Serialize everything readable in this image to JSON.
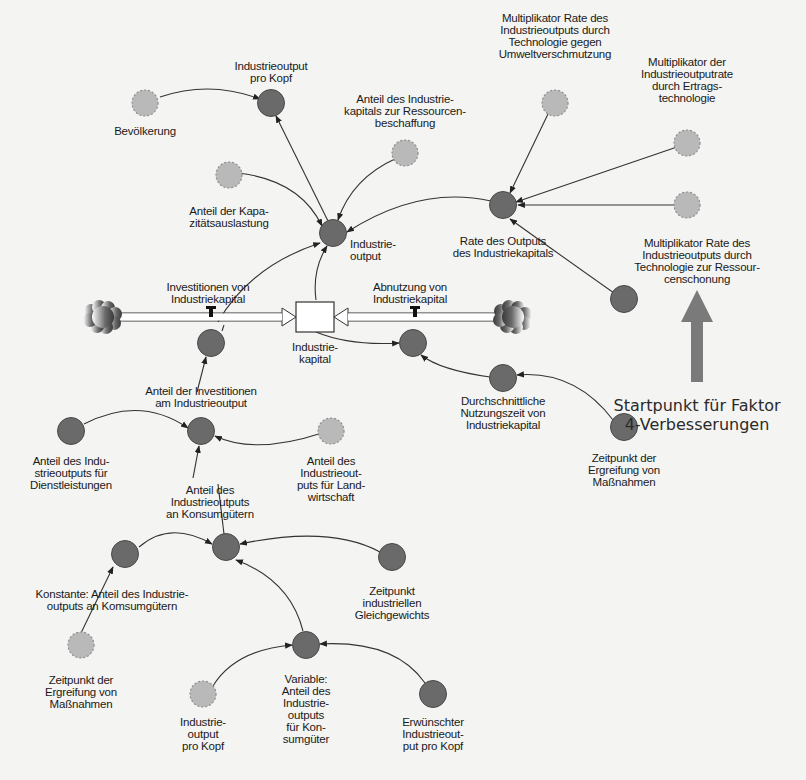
{
  "diagram": {
    "title": "",
    "colors": {
      "background": "#f4f4f2",
      "auxiliary_fill": "#6a6a6a",
      "auxiliary_stroke": "#4a4a4a",
      "external_fill": "#b9b9b9",
      "external_stroke": "#8e8e8e",
      "link": "#333333",
      "callout_arrow": "#7a7a7a",
      "stock_fill": "#ffffff"
    },
    "nodes": [
      {
        "id": "bevoelkerung",
        "type": "external",
        "x": 145,
        "y": 103,
        "label": "Bevölkerung",
        "lx": 145,
        "ly": 125
      },
      {
        "id": "io_pro_kopf",
        "type": "auxiliary",
        "x": 271,
        "y": 103,
        "label": "Industrieoutput\npro Kopf",
        "lx": 271,
        "ly": 60
      },
      {
        "id": "anteil_kapital_ressourcen",
        "type": "external",
        "x": 405,
        "y": 153,
        "label": "Anteil des Industrie-\nkapitals zur Ressourcen-\nbeschaffung",
        "lx": 405,
        "ly": 93
      },
      {
        "id": "kapazitaet",
        "type": "external",
        "x": 229,
        "y": 175,
        "label": "Anteil der Kapa-\nzitätsauslastung",
        "lx": 229,
        "ly": 205
      },
      {
        "id": "industrieoutput",
        "type": "auxiliary",
        "x": 333,
        "y": 233,
        "label": "Industrie-\noutput",
        "lx": 350,
        "ly": 238,
        "align": "left"
      },
      {
        "id": "mult_umwelt",
        "type": "external",
        "x": 555,
        "y": 103,
        "label": "Multiplikator Rate des\nIndustrieoutputs durch\nTechnologie gegen\nUmweltverschmutzung",
        "lx": 555,
        "ly": 12
      },
      {
        "id": "mult_ertrag",
        "type": "external",
        "x": 687,
        "y": 143,
        "label": "Multiplikator der\nIndustrieoutputrate\ndurch Ertrags-\ntechnologie",
        "lx": 687,
        "ly": 56
      },
      {
        "id": "mult_ressourcen_ext",
        "type": "external",
        "x": 687,
        "y": 205,
        "label": "",
        "lx": 0,
        "ly": 0
      },
      {
        "id": "rate_output",
        "type": "auxiliary",
        "x": 503,
        "y": 205,
        "label": "Rate des Outputs\ndes Industriekapitals",
        "lx": 503,
        "ly": 235
      },
      {
        "id": "mult_ressourcen",
        "type": "auxiliary",
        "x": 624,
        "y": 299,
        "label": "Multiplikator Rate des\nIndustrieoutputs durch\nTechnologie zur Ressour-\ncenschonung",
        "lx": 697,
        "ly": 237
      },
      {
        "id": "investitionen_aux",
        "type": "auxiliary",
        "x": 211,
        "y": 343,
        "label": "",
        "lx": 0,
        "ly": 0
      },
      {
        "id": "abnutzung_aux",
        "type": "auxiliary",
        "x": 413,
        "y": 343,
        "label": "",
        "lx": 0,
        "ly": 0
      },
      {
        "id": "nutzungszeit",
        "type": "auxiliary",
        "x": 503,
        "y": 378,
        "label": "Durchschnittliche\nNutzungszeit von\nIndustriekapital",
        "lx": 503,
        "ly": 395
      },
      {
        "id": "zeitpunkt_massnahmen_r",
        "type": "auxiliary",
        "x": 624,
        "y": 427,
        "label": "Zeitpunkt der\nErgreifung von\nMaßnahmen",
        "lx": 624,
        "ly": 452
      },
      {
        "id": "anteil_investitionen",
        "type": "auxiliary",
        "x": 201,
        "y": 431,
        "label": "Anteil der Investitionen\nam Industrieoutput",
        "lx": 201,
        "ly": 385
      },
      {
        "id": "anteil_dienstleistungen",
        "type": "auxiliary",
        "x": 71,
        "y": 431,
        "label": "Anteil des Indu-\nstrieoutputs für\nDienstleistungen",
        "lx": 71,
        "ly": 455
      },
      {
        "id": "anteil_landwirtschaft",
        "type": "external",
        "x": 331,
        "y": 431,
        "label": "Anteil des\nIndustrieout-\nputs für Land-\nwirtschaft",
        "lx": 331,
        "ly": 455
      },
      {
        "id": "anteil_konsumgueter",
        "type": "auxiliary",
        "x": 226,
        "y": 547,
        "label": "Anteil des\nIndustrieoutputs\nan Konsumgütern",
        "lx": 210,
        "ly": 484
      },
      {
        "id": "konstante",
        "type": "auxiliary",
        "x": 125,
        "y": 554,
        "label": "Konstante: Anteil des Industrie-\noutputs an Komsumgütern",
        "lx": 112,
        "ly": 588
      },
      {
        "id": "zeitpunkt_gleichgewicht",
        "type": "auxiliary",
        "x": 392,
        "y": 557,
        "label": "Zeitpunkt\nindustriellen\nGleichgewichts",
        "lx": 392,
        "ly": 585
      },
      {
        "id": "zeitpunkt_massnahmen_l",
        "type": "external",
        "x": 81,
        "y": 645,
        "label": "Zeitpunkt der\nErgreifung von\nMaßnahmen",
        "lx": 81,
        "ly": 674
      },
      {
        "id": "io_pro_kopf_2",
        "type": "external",
        "x": 203,
        "y": 694,
        "label": "Industrie-\noutput\npro Kopf",
        "lx": 203,
        "ly": 716
      },
      {
        "id": "variable_konsum",
        "type": "auxiliary",
        "x": 306,
        "y": 645,
        "label": "Variable:\nAnteil des\nIndustrie-\noutputs\nfür Kon-\nsumgüter",
        "lx": 306,
        "ly": 673
      },
      {
        "id": "erwuenschter_io",
        "type": "auxiliary",
        "x": 433,
        "y": 694,
        "label": "Erwünschter\nIndustrieout-\nput pro Kopf",
        "lx": 433,
        "ly": 716
      }
    ],
    "stock": {
      "id": "industriekapital",
      "x": 296,
      "y": 302,
      "w": 38,
      "h": 30,
      "label": "Industrie-\nkapital",
      "lx": 315,
      "ly": 341
    },
    "clouds": [
      {
        "id": "source-cloud",
        "x": 103,
        "y": 317
      },
      {
        "id": "sink-cloud",
        "x": 513,
        "y": 317
      }
    ],
    "flows": [
      {
        "id": "investitionen",
        "label": "Investitionen von\nIndustriekapital",
        "lx": 208,
        "ly": 281,
        "valve_x": 211,
        "from_x": 120,
        "to_x": 296,
        "dir": "right"
      },
      {
        "id": "abnutzung",
        "label": "Abnutzung von\nIndustriekapital",
        "lx": 410,
        "ly": 281,
        "valve_x": 415,
        "from_x": 497,
        "to_x": 334,
        "dir": "left"
      }
    ],
    "links": [
      {
        "d": "M160,97 Q210,80 260,99"
      },
      {
        "d": "M328,221 L276,116"
      },
      {
        "d": "M238,173 Q300,180 322,226"
      },
      {
        "d": "M397,158 Q352,178 338,220"
      },
      {
        "d": "M491,201 Q420,185 347,232"
      },
      {
        "d": "M548,114 L510,193"
      },
      {
        "d": "M677,147 L516,202"
      },
      {
        "d": "M676,205 L518,205"
      },
      {
        "d": "M614,293 Q570,262 510,219"
      },
      {
        "d": "M218,322 Q250,266 320,243"
      },
      {
        "d": "M316,300 Q312,270 327,246"
      },
      {
        "d": "M316,332 Q350,346 399,343"
      },
      {
        "d": "M613,420 Q575,370 517,375"
      },
      {
        "d": "M490,377 Q440,370 421,355"
      },
      {
        "d": "M197,392 L206,357"
      },
      {
        "d": "M84,424 Q140,395 188,428"
      },
      {
        "d": "M322,433 Q255,455 215,436"
      },
      {
        "d": "M193,478 L199,446"
      },
      {
        "d": "M139,547 Q170,520 212,544"
      },
      {
        "d": "M380,552 Q330,525 240,544"
      },
      {
        "d": "M303,631 Q290,580 236,560"
      },
      {
        "d": "M213,686 Q235,650 292,645"
      },
      {
        "d": "M425,683 Q395,640 320,644"
      },
      {
        "d": "M81,633 L96,602",
        "noarrow": true
      },
      {
        "d": "M96,602 L113,567"
      },
      {
        "d": "M218,484 L224,534",
        "noarrow": true
      },
      {
        "d": "M222,331 L224,325",
        "noarrow": true
      }
    ],
    "callout": {
      "text": "Startpunkt für Faktor\n4-Verbesserungen",
      "arrow": {
        "x": 697,
        "y_top": 290,
        "y_bottom": 382
      }
    }
  }
}
